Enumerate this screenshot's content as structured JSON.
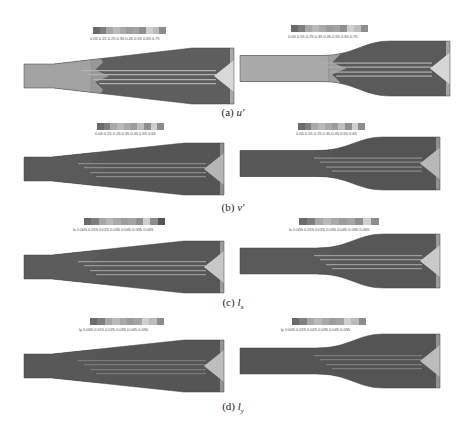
{
  "figure": {
    "rows": [
      {
        "id": "a",
        "caption_prefix": "(a)",
        "caption_var": "u'",
        "plots": [
          {
            "side": "left",
            "geometry": "linear-diffuser",
            "colorbar": {
              "var_label": "",
              "ticks": "0.05 0.15 0.25 0.35 0.45 0.55 0.65 0.75",
              "colors": [
                "#6b6b6b",
                "#7f7f7f",
                "#a8a8a8",
                "#b9b9b9",
                "#a9a9a9",
                "#9c9c9c",
                "#a4a4a4",
                "#8f8f8f",
                "#cfcfcf",
                "#bcbcbc",
                "#8d8d8d"
              ]
            },
            "field": {
              "inlet_color": "#a2a2a2",
              "body_color": "#5e5e5e",
              "streak_color": "#b3b3b3",
              "outlet_color": "#d8d8d8"
            }
          },
          {
            "side": "right",
            "geometry": "curved-diffuser",
            "colorbar": {
              "var_label": "",
              "ticks": "0.05 0.15 0.25 0.35 0.45 0.55 0.65 0.75",
              "colors": [
                "#6b6b6b",
                "#7f7f7f",
                "#a8a8a8",
                "#b9b9b9",
                "#a9a9a9",
                "#9c9c9c",
                "#a4a4a4",
                "#8f8f8f",
                "#cfcfcf",
                "#bcbcbc",
                "#8d8d8d"
              ]
            },
            "field": {
              "inlet_color": "#a9a9a9",
              "body_color": "#5a5a5a",
              "streak_color": "#b0b0b0",
              "outlet_color": "#d6d6d6"
            }
          }
        ]
      },
      {
        "id": "b",
        "caption_prefix": "(b)",
        "caption_var": "v'",
        "plots": [
          {
            "side": "left",
            "geometry": "linear-diffuser",
            "colorbar": {
              "var_label": "",
              "ticks": "0.05 0.15 0.25 0.35 0.45 0.55 0.65",
              "colors": [
                "#6b6b6b",
                "#7f7f7f",
                "#a8a8a8",
                "#b9b9b9",
                "#a9a9a9",
                "#9c9c9c",
                "#bdbdbd",
                "#8f8f8f",
                "#cfcfcf",
                "#8d8d8d"
              ]
            },
            "field": {
              "inlet_color": "#5a5a5a",
              "body_color": "#555555",
              "streak_color": "#8a8a8a",
              "outlet_color": "#b5b5b5"
            }
          },
          {
            "side": "right",
            "geometry": "curved-diffuser",
            "colorbar": {
              "var_label": "",
              "ticks": "0.05 0.15 0.25 0.35 0.45 0.55 0.65",
              "colors": [
                "#6b6b6b",
                "#7f7f7f",
                "#a8a8a8",
                "#b9b9b9",
                "#a9a9a9",
                "#9c9c9c",
                "#bdbdbd",
                "#8f8f8f",
                "#cfcfcf",
                "#8d8d8d"
              ]
            },
            "field": {
              "inlet_color": "#575757",
              "body_color": "#545454",
              "streak_color": "#8d8d8d",
              "outlet_color": "#b8b8b8"
            }
          }
        ]
      },
      {
        "id": "c",
        "caption_prefix": "(c)",
        "caption_var": "l",
        "caption_sub": "x",
        "plots": [
          {
            "side": "left",
            "geometry": "linear-diffuser",
            "colorbar": {
              "var_label": "lx",
              "ticks": "0.005 0.015 0.025 0.035 0.045 0.055 0.065",
              "colors": [
                "#6b6b6b",
                "#7f7f7f",
                "#a8a8a8",
                "#b9b9b9",
                "#a9a9a9",
                "#9c9c9c",
                "#a4a4a4",
                "#8f8f8f",
                "#cfcfcf",
                "#8d8d8d",
                "#555555"
              ]
            },
            "field": {
              "inlet_color": "#5c5c5c",
              "body_color": "#575757",
              "streak_color": "#9a9a9a",
              "outlet_color": "#c7c7c7"
            }
          },
          {
            "side": "right",
            "geometry": "curved-diffuser",
            "colorbar": {
              "var_label": "lx",
              "ticks": "0.005 0.015 0.025 0.035 0.045 0.055 0.065",
              "colors": [
                "#6b6b6b",
                "#7f7f7f",
                "#a8a8a8",
                "#b9b9b9",
                "#a9a9a9",
                "#9c9c9c",
                "#a4a4a4",
                "#8f8f8f",
                "#cfcfcf",
                "#8d8d8d"
              ]
            },
            "field": {
              "inlet_color": "#5a5a5a",
              "body_color": "#575757",
              "streak_color": "#9c9c9c",
              "outlet_color": "#c9c9c9"
            }
          }
        ]
      },
      {
        "id": "d",
        "caption_prefix": "(d)",
        "caption_var": "l",
        "caption_sub": "y",
        "plots": [
          {
            "side": "left",
            "geometry": "linear-diffuser",
            "colorbar": {
              "var_label": "ly",
              "ticks": "0.005 0.015 0.025 0.035 0.045 0.055",
              "colors": [
                "#6b6b6b",
                "#7f7f7f",
                "#a8a8a8",
                "#b9b9b9",
                "#a9a9a9",
                "#9c9c9c",
                "#a4a4a4",
                "#cfcfcf",
                "#bcbcbc",
                "#8d8d8d"
              ]
            },
            "field": {
              "inlet_color": "#585858",
              "body_color": "#555555",
              "streak_color": "#7a7a7a",
              "outlet_color": "#bdbdbd"
            }
          },
          {
            "side": "right",
            "geometry": "curved-diffuser",
            "colorbar": {
              "var_label": "ly",
              "ticks": "0.005 0.015 0.025 0.035 0.045 0.055",
              "colors": [
                "#6b6b6b",
                "#7f7f7f",
                "#a8a8a8",
                "#b9b9b9",
                "#a9a9a9",
                "#9c9c9c",
                "#a4a4a4",
                "#cfcfcf",
                "#bcbcbc",
                "#8d8d8d"
              ]
            },
            "field": {
              "inlet_color": "#555555",
              "body_color": "#545454",
              "streak_color": "#7c7c7c",
              "outlet_color": "#bcbcbc"
            }
          }
        ]
      }
    ]
  }
}
